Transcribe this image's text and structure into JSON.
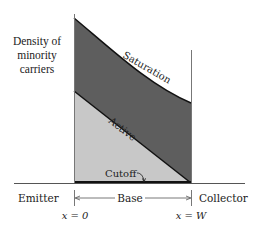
{
  "diagram": {
    "y_axis_label": "Density of minority carriers",
    "y_axis_label_lines": [
      "Density of",
      "minority",
      "carriers"
    ],
    "regions": {
      "emitter": "Emitter",
      "base": "Base",
      "collector": "Collector"
    },
    "positions": {
      "left": "x = 0",
      "right": "x = W"
    },
    "curves": {
      "saturation": "Saturation",
      "active": "Active",
      "cutoff": "Cutoff"
    },
    "colors": {
      "saturation_fill": "#5e5e5e",
      "active_fill": "#c8c8c8",
      "line": "#111111",
      "axis": "#777777"
    }
  }
}
